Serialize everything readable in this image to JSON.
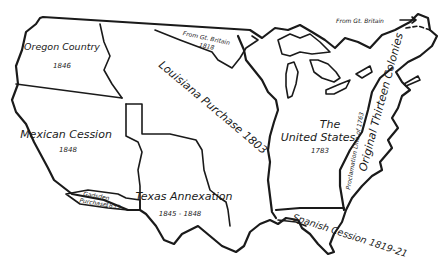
{
  "map": {
    "title": "Territorial Growth of the United States",
    "regions": [
      {
        "id": "oregon",
        "name": "Oregon Country",
        "year": "1846"
      },
      {
        "id": "mexican",
        "name": "Mexican Cession",
        "year": "1848"
      },
      {
        "id": "gadsden",
        "name": "Gadsden",
        "name2": "Purchase",
        "year": "1853"
      },
      {
        "id": "texas",
        "name": "Texas Annexation",
        "year": "1845 - 1848"
      },
      {
        "id": "louisiana",
        "name": "Louisiana Purchase 1803"
      },
      {
        "id": "britain1818",
        "name": "From Gt. Britain",
        "year": "1818"
      },
      {
        "id": "us1783",
        "name1": "The",
        "name2": "United States",
        "year": "1783"
      },
      {
        "id": "colonies",
        "name": "Original Thirteen Colonies"
      },
      {
        "id": "proclamation",
        "name": "Proclamation Line of 1763"
      },
      {
        "id": "spanish",
        "name": "Spanish Cession 1819-21"
      },
      {
        "id": "britain_ne",
        "name": "From Gt. Britain"
      }
    ]
  }
}
